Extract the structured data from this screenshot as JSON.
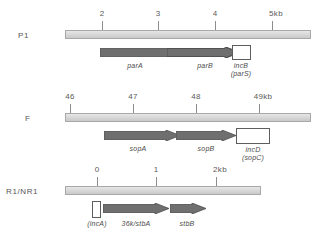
{
  "figure": {
    "type": "plasmid-partition-locus-map",
    "rows": [
      {
        "name": "P1",
        "scale_unit": "kb",
        "axis": {
          "ticks": [
            {
              "label": "2",
              "x": 102
            },
            {
              "label": "3",
              "x": 158
            },
            {
              "label": "4",
              "x": 215
            },
            {
              "label": "5kb",
              "x": 272
            }
          ]
        },
        "genes": [
          {
            "label": "parA",
            "sub": "",
            "shape": "arrow",
            "fill": "dark"
          },
          {
            "label": "parB",
            "sub": "",
            "shape": "arrow",
            "fill": "dark"
          },
          {
            "label": "incB",
            "sub": "(parS)",
            "shape": "box",
            "fill": "white"
          }
        ]
      },
      {
        "name": "F",
        "scale_unit": "kb",
        "axis": {
          "ticks": [
            {
              "label": "46",
              "x": 70
            },
            {
              "label": "47",
              "x": 133
            },
            {
              "label": "48",
              "x": 196
            },
            {
              "label": "49kb",
              "x": 259
            }
          ]
        },
        "genes": [
          {
            "label": "sopA",
            "sub": "",
            "shape": "arrow",
            "fill": "dark"
          },
          {
            "label": "sopB",
            "sub": "",
            "shape": "arrow",
            "fill": "dark"
          },
          {
            "label": "incD",
            "sub": "(sopC)",
            "shape": "box",
            "fill": "white"
          }
        ]
      },
      {
        "name": "R1/NR1",
        "scale_unit": "kb",
        "axis": {
          "ticks": [
            {
              "label": "0",
              "x": 97
            },
            {
              "label": "1",
              "x": 156
            },
            {
              "label": "2kb",
              "x": 216
            }
          ]
        },
        "genes": [
          {
            "label": "(incA)",
            "sub": "",
            "shape": "box",
            "fill": "white"
          },
          {
            "label": "36k/stbA",
            "sub": "",
            "shape": "arrow",
            "fill": "dark"
          },
          {
            "label": "stbB",
            "sub": "",
            "shape": "arrow",
            "fill": "dark"
          }
        ]
      }
    ],
    "colors": {
      "bar_fill": "#dcdcdc",
      "bar_stroke": "#a8a8a8",
      "arrow_fill": "#6f6f6f",
      "arrow_stroke": "#4c4c4c",
      "box_fill": "#ffffff",
      "box_stroke": "#5d5d5d",
      "text": "#4a4a4a",
      "background": "#ffffff"
    }
  }
}
